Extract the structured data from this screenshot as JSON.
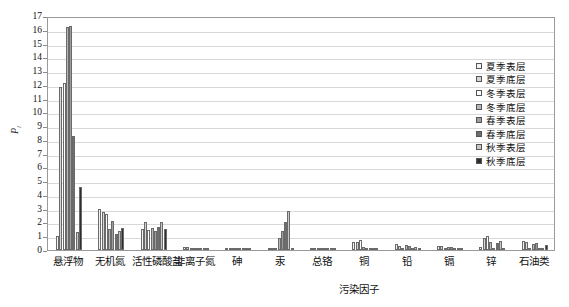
{
  "chart_data": {
    "type": "bar",
    "title": "",
    "xlabel": "污染因子",
    "ylabel": "Pi",
    "ylim": [
      0,
      17
    ],
    "ytick_labels": [
      "0",
      "1",
      "2",
      "3",
      "4",
      "5",
      "6",
      "7",
      "8",
      "9",
      "10",
      "11",
      "12",
      "13",
      "14",
      "15",
      "16",
      "17"
    ],
    "grid": true,
    "legend_position": "top-right",
    "categories": [
      "悬浮物",
      "无机氮",
      "活性磷酸盐",
      "非离子氮",
      "砷",
      "汞",
      "总铬",
      "铜",
      "铅",
      "镉",
      "锌",
      "石油类"
    ],
    "series": [
      {
        "name": "夏季表层",
        "color": "#f2f2f2",
        "values": [
          1.05,
          2.95,
          1.55,
          0.2,
          0.08,
          0.1,
          0.04,
          0.55,
          0.42,
          0.3,
          0.25,
          0.62
        ]
      },
      {
        "name": "夏季底层",
        "color": "#d6d6d6",
        "values": [
          11.85,
          2.75,
          2.0,
          0.22,
          0.07,
          0.08,
          0.05,
          0.58,
          0.3,
          0.28,
          0.88,
          0.58
        ]
      },
      {
        "name": "冬季表层",
        "color": "#ffffff",
        "values": [
          12.1,
          2.6,
          1.48,
          0.18,
          0.06,
          0.09,
          0.04,
          0.72,
          0.12,
          0.05,
          1.05,
          0.12
        ]
      },
      {
        "name": "冬季底层",
        "color": "#b8b8b8",
        "values": [
          16.2,
          1.55,
          1.6,
          0.1,
          0.05,
          0.85,
          0.06,
          0.2,
          0.35,
          0.22,
          0.55,
          0.45
        ]
      },
      {
        "name": "春季表层",
        "color": "#9d9d9d",
        "values": [
          16.25,
          2.1,
          1.4,
          0.12,
          0.05,
          1.38,
          0.05,
          0.15,
          0.28,
          0.2,
          0.1,
          0.48
        ]
      },
      {
        "name": "春季底层",
        "color": "#6e6e6e",
        "values": [
          8.3,
          1.15,
          1.7,
          0.1,
          0.04,
          2.05,
          0.04,
          0.12,
          0.1,
          0.05,
          0.52,
          0.1
        ]
      },
      {
        "name": "秋季表层",
        "color": "#c9c9c9",
        "values": [
          1.3,
          1.35,
          2.0,
          0.18,
          0.14,
          2.85,
          0.05,
          0.1,
          0.25,
          0.1,
          0.62,
          0.1
        ]
      },
      {
        "name": "秋季底层",
        "color": "#2e2e2e",
        "values": [
          4.55,
          1.6,
          1.55,
          0.08,
          0.06,
          0.05,
          0.03,
          0.06,
          0.05,
          0.04,
          0.08,
          0.4
        ]
      }
    ]
  },
  "legend": {
    "items": [
      {
        "label": "夏季表层"
      },
      {
        "label": "夏季底层"
      },
      {
        "label": "冬季表层"
      },
      {
        "label": "冬季底层"
      },
      {
        "label": "春季表层"
      },
      {
        "label": "春季底层"
      },
      {
        "label": "秋季表层"
      },
      {
        "label": "秋季底层"
      }
    ]
  }
}
